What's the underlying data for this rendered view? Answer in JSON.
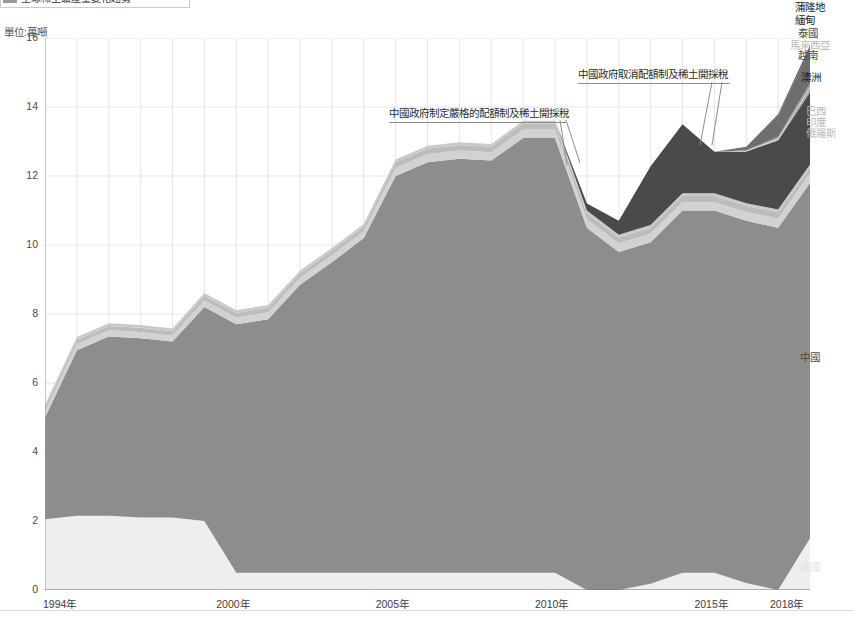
{
  "header": {
    "title": "全球稀土礦產量變化趨勢",
    "unit_label": "單位:萬噸"
  },
  "annotations": [
    {
      "id": "quota-start",
      "text": "中國政府制定嚴格的配額制及稀土開採稅"
    },
    {
      "id": "quota-end",
      "text": "中國政府取消配額制及稀土開採稅"
    }
  ],
  "series_labels": [
    {
      "key": "burundi",
      "text": "蒲隆地",
      "tone": "dark"
    },
    {
      "key": "myanmar",
      "text": "緬甸",
      "tone": "dark"
    },
    {
      "key": "thailand",
      "text": "泰國",
      "tone": "mid"
    },
    {
      "key": "malaysia",
      "text": "馬來西亞",
      "tone": "light"
    },
    {
      "key": "vietnam",
      "text": "越南",
      "tone": "mid"
    },
    {
      "key": "australia",
      "text": "澳洲",
      "tone": "dark"
    },
    {
      "key": "brazil",
      "text": "巴西",
      "tone": "light"
    },
    {
      "key": "india",
      "text": "印度",
      "tone": "light"
    },
    {
      "key": "russia",
      "text": "俄羅斯",
      "tone": "light"
    },
    {
      "key": "china",
      "text": "中國",
      "tone": "mid"
    },
    {
      "key": "usa",
      "text": "美國",
      "tone": "faint"
    }
  ],
  "colors": {
    "china": "#8d8d8d",
    "usa": "#eeeeee",
    "australia": "#4a4a4a",
    "russia": "#d2d2d2",
    "india": "#bcbcbc",
    "brazil": "#c9c9c9",
    "vietnam": "#a8a8a8",
    "malaysia": "#dcdcdc",
    "thailand": "#9e9e9e",
    "myanmar": "#6e6e6e",
    "burundi": "#5a5a5a",
    "grid": "#e6e6e6",
    "axis": "#9a9a9a",
    "text": "#3d3d3d"
  },
  "chart_data": {
    "type": "area",
    "stacked": true,
    "title": "全球稀土礦產量變化趨勢",
    "xlabel": "",
    "ylabel": "單位:萬噸",
    "ylim": [
      0,
      16
    ],
    "yticks": [
      0,
      2,
      4,
      6,
      8,
      10,
      12,
      14,
      16
    ],
    "ytick_labels": [
      "0",
      "2",
      "4",
      "6",
      "8",
      "10",
      "12",
      "14",
      "16"
    ],
    "grid": true,
    "legend_position": "right-inline",
    "x": [
      1994,
      1995,
      1996,
      1997,
      1998,
      1999,
      2000,
      2001,
      2002,
      2003,
      2004,
      2005,
      2006,
      2007,
      2008,
      2009,
      2010,
      2011,
      2012,
      2013,
      2014,
      2015,
      2016,
      2017,
      2018
    ],
    "xtick_values": [
      1994,
      2000,
      2005,
      2010,
      2015,
      2018
    ],
    "xtick_labels": [
      "1994年",
      "2000年",
      "2005年",
      "2010年",
      "2015年",
      "2018年"
    ],
    "series": [
      {
        "name": "美國",
        "key": "usa",
        "values": [
          2.05,
          2.15,
          2.15,
          2.1,
          2.1,
          2.0,
          0.5,
          0.5,
          0.5,
          0.5,
          0.5,
          0.5,
          0.5,
          0.5,
          0.5,
          0.5,
          0.5,
          0.0,
          0.0,
          0.18,
          0.5,
          0.5,
          0.2,
          0.0,
          1.5
        ]
      },
      {
        "name": "中國",
        "key": "china",
        "values": [
          2.95,
          4.8,
          5.2,
          5.2,
          5.1,
          6.2,
          7.2,
          7.35,
          8.35,
          9.0,
          9.7,
          11.5,
          11.9,
          12.0,
          11.95,
          12.6,
          12.6,
          10.5,
          9.8,
          9.9,
          10.5,
          10.5,
          10.5,
          10.5,
          10.3
        ]
      },
      {
        "name": "俄羅斯",
        "key": "russia",
        "values": [
          0.18,
          0.18,
          0.18,
          0.18,
          0.18,
          0.2,
          0.2,
          0.2,
          0.2,
          0.2,
          0.2,
          0.24,
          0.24,
          0.24,
          0.24,
          0.25,
          0.25,
          0.25,
          0.25,
          0.25,
          0.25,
          0.25,
          0.26,
          0.27,
          0.27
        ]
      },
      {
        "name": "印度",
        "key": "india",
        "values": [
          0.12,
          0.12,
          0.12,
          0.12,
          0.12,
          0.13,
          0.13,
          0.13,
          0.13,
          0.13,
          0.13,
          0.16,
          0.16,
          0.16,
          0.16,
          0.17,
          0.17,
          0.17,
          0.17,
          0.17,
          0.17,
          0.17,
          0.17,
          0.18,
          0.18
        ]
      },
      {
        "name": "巴西",
        "key": "brazil",
        "values": [
          0.08,
          0.08,
          0.08,
          0.08,
          0.08,
          0.08,
          0.08,
          0.08,
          0.08,
          0.08,
          0.08,
          0.08,
          0.08,
          0.08,
          0.08,
          0.08,
          0.08,
          0.08,
          0.08,
          0.08,
          0.08,
          0.08,
          0.08,
          0.08,
          0.08
        ]
      },
      {
        "name": "澳洲",
        "key": "australia",
        "values": [
          0.0,
          0.0,
          0.0,
          0.0,
          0.0,
          0.0,
          0.0,
          0.0,
          0.0,
          0.0,
          0.0,
          0.0,
          0.0,
          0.0,
          0.0,
          0.0,
          0.0,
          0.2,
          0.4,
          1.7,
          2.0,
          1.2,
          1.5,
          2.0,
          2.1
        ]
      },
      {
        "name": "越南",
        "key": "vietnam",
        "values": [
          0.0,
          0.0,
          0.0,
          0.0,
          0.0,
          0.0,
          0.0,
          0.0,
          0.0,
          0.0,
          0.0,
          0.0,
          0.0,
          0.0,
          0.0,
          0.0,
          0.0,
          0.0,
          0.0,
          0.0,
          0.0,
          0.0,
          0.0,
          0.03,
          0.12
        ]
      },
      {
        "name": "馬來西亞",
        "key": "malaysia",
        "values": [
          0.0,
          0.0,
          0.0,
          0.0,
          0.0,
          0.0,
          0.0,
          0.0,
          0.0,
          0.0,
          0.0,
          0.0,
          0.0,
          0.0,
          0.0,
          0.0,
          0.0,
          0.0,
          0.0,
          0.0,
          0.0,
          0.0,
          0.02,
          0.03,
          0.03
        ]
      },
      {
        "name": "泰國",
        "key": "thailand",
        "values": [
          0.0,
          0.0,
          0.0,
          0.0,
          0.0,
          0.0,
          0.0,
          0.0,
          0.0,
          0.0,
          0.0,
          0.0,
          0.0,
          0.0,
          0.0,
          0.0,
          0.0,
          0.0,
          0.0,
          0.0,
          0.0,
          0.0,
          0.02,
          0.05,
          0.1
        ]
      },
      {
        "name": "緬甸",
        "key": "myanmar",
        "values": [
          0.0,
          0.0,
          0.0,
          0.0,
          0.0,
          0.0,
          0.0,
          0.0,
          0.0,
          0.0,
          0.0,
          0.0,
          0.0,
          0.0,
          0.0,
          0.0,
          0.0,
          0.0,
          0.0,
          0.0,
          0.0,
          0.0,
          0.1,
          0.6,
          1.0
        ]
      },
      {
        "name": "蒲隆地",
        "key": "burundi",
        "values": [
          0.0,
          0.0,
          0.0,
          0.0,
          0.0,
          0.0,
          0.0,
          0.0,
          0.0,
          0.0,
          0.0,
          0.0,
          0.0,
          0.0,
          0.0,
          0.0,
          0.0,
          0.0,
          0.0,
          0.0,
          0.0,
          0.0,
          0.0,
          0.05,
          0.1
        ]
      }
    ]
  }
}
